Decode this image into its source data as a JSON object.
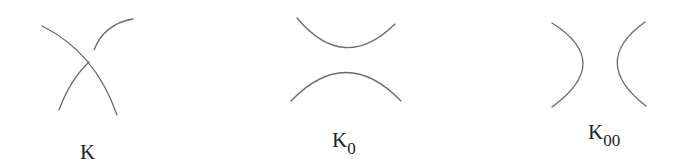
{
  "figure": {
    "panels": [
      {
        "id": "K",
        "label": "K",
        "subscript": "",
        "description": "crossing"
      },
      {
        "id": "K0",
        "label": "K",
        "subscript": "0",
        "description": "horizontal smoothing"
      },
      {
        "id": "K00",
        "label": "K",
        "subscript": "00",
        "description": "vertical smoothing"
      }
    ],
    "stroke_color": "#6a6a6a",
    "text_color": "#222222"
  }
}
